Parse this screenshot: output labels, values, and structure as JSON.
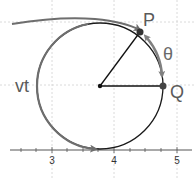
{
  "diagram": {
    "labels": {
      "P": "P",
      "Q": "Q",
      "theta": "θ",
      "arc_length": "vt"
    },
    "axis": {
      "ticks": [
        "3",
        "4",
        "5"
      ]
    },
    "colors": {
      "circle": "#1a1a1a",
      "path": "#6e6e6e",
      "theta_arc": "#808080",
      "radius": "#111111",
      "grid": "#d0d0d0",
      "axis": "#555555",
      "label": "#5a5a5a"
    }
  }
}
